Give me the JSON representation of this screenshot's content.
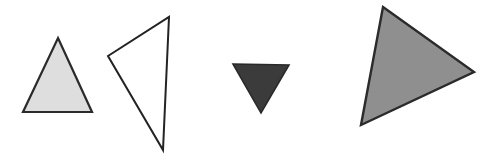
{
  "canvas": {
    "width": 498,
    "height": 163,
    "background_color": "#ffffff",
    "description": "Four triangles of varying size, fill shade and orientation on a plain white background"
  },
  "shapes": [
    {
      "name": "triangle-light-gray-upright",
      "shape": "triangle",
      "orientation": "point-up",
      "fill_color": "#dedede",
      "stroke_color": "#2b2b2b",
      "stroke_width": 2.2,
      "points": "58,38 92,112 23,112",
      "vertices": [
        {
          "x": 58,
          "y": 38
        },
        {
          "x": 92,
          "y": 112
        },
        {
          "x": 23,
          "y": 112
        }
      ]
    },
    {
      "name": "triangle-white-outline-tilted",
      "shape": "triangle",
      "orientation": "tilted-right",
      "fill_color": "#ffffff",
      "stroke_color": "#232323",
      "stroke_width": 2.0,
      "points": "169,17 163,150 108,56",
      "vertices": [
        {
          "x": 169,
          "y": 17
        },
        {
          "x": 163,
          "y": 150
        },
        {
          "x": 108,
          "y": 56
        }
      ]
    },
    {
      "name": "triangle-dark-inverted",
      "shape": "triangle",
      "orientation": "point-down",
      "fill_color": "#3b3b3b",
      "stroke_color": "#2a2a2a",
      "stroke_width": 1.6,
      "points": "233,64 289,65 261,113",
      "vertices": [
        {
          "x": 233,
          "y": 64
        },
        {
          "x": 289,
          "y": 65
        },
        {
          "x": 261,
          "y": 113
        }
      ]
    },
    {
      "name": "triangle-gray-large-rotated",
      "shape": "triangle",
      "orientation": "rotated-point-right",
      "fill_color": "#8f8f8f",
      "stroke_color": "#2b2b2b",
      "stroke_width": 2.4,
      "points": "383,7 474,72 361,125",
      "vertices": [
        {
          "x": 383,
          "y": 7
        },
        {
          "x": 474,
          "y": 72
        },
        {
          "x": 361,
          "y": 125
        }
      ]
    }
  ]
}
